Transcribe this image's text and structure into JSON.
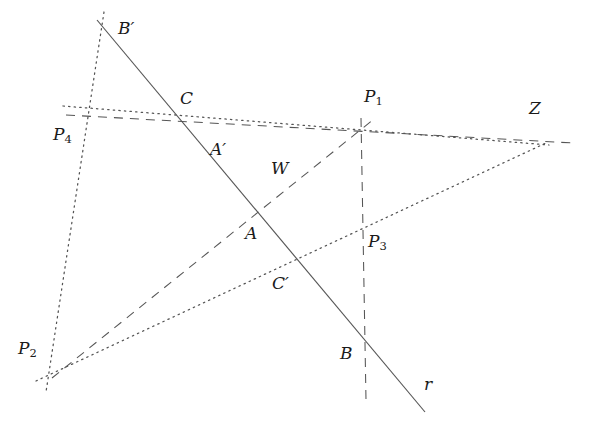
{
  "figure": {
    "title": "Projective geometry construction: line r with points B', C, A', A, C', B and centers P1, P2, P3, P4, W, Z",
    "width": 594,
    "height": 431,
    "background_color": "#ffffff",
    "stroke_color": "#555555",
    "label_color": "#1a1a1a"
  },
  "labels": [
    {
      "id": "B-prime",
      "base": "B",
      "prime": "′",
      "sub": "",
      "x": 118,
      "y": 20,
      "name": "label-b-prime"
    },
    {
      "id": "C",
      "base": "C",
      "prime": "",
      "sub": "",
      "x": 180,
      "y": 90,
      "name": "label-c"
    },
    {
      "id": "P1",
      "base": "P",
      "prime": "",
      "sub": "1",
      "x": 364,
      "y": 88,
      "name": "label-p1"
    },
    {
      "id": "Z",
      "base": "Z",
      "prime": "",
      "sub": "",
      "x": 529,
      "y": 100,
      "name": "label-z"
    },
    {
      "id": "P4",
      "base": "P",
      "prime": "",
      "sub": "4",
      "x": 53,
      "y": 126,
      "name": "label-p4"
    },
    {
      "id": "A-prime",
      "base": "A",
      "prime": "′",
      "sub": "",
      "x": 210,
      "y": 141,
      "name": "label-a-prime"
    },
    {
      "id": "W",
      "base": "W",
      "prime": "",
      "sub": "",
      "x": 271,
      "y": 160,
      "name": "label-w"
    },
    {
      "id": "A",
      "base": "A",
      "prime": "",
      "sub": "",
      "x": 245,
      "y": 225,
      "name": "label-a"
    },
    {
      "id": "P3",
      "base": "P",
      "prime": "",
      "sub": "3",
      "x": 368,
      "y": 233,
      "name": "label-p3"
    },
    {
      "id": "C-prime",
      "base": "C",
      "prime": "′",
      "sub": "",
      "x": 272,
      "y": 275,
      "name": "label-c-prime"
    },
    {
      "id": "P2",
      "base": "P",
      "prime": "",
      "sub": "2",
      "x": 18,
      "y": 340,
      "name": "label-p2"
    },
    {
      "id": "B",
      "base": "B",
      "prime": "",
      "sub": "",
      "x": 340,
      "y": 345,
      "name": "label-b"
    },
    {
      "id": "r",
      "base": "r",
      "prime": "",
      "sub": "",
      "x": 424,
      "y": 376,
      "name": "label-r"
    }
  ],
  "points": {
    "B_prime": {
      "x": 105,
      "y": 28
    },
    "C": {
      "x": 177,
      "y": 123
    },
    "A_prime": {
      "x": 210,
      "y": 155
    },
    "A": {
      "x": 248,
      "y": 225
    },
    "C_prime": {
      "x": 293,
      "y": 275
    },
    "B": {
      "x": 365,
      "y": 344
    },
    "P1": {
      "x": 362,
      "y": 131
    },
    "P2": {
      "x": 58,
      "y": 372
    },
    "P3": {
      "x": 363,
      "y": 224
    },
    "P4": {
      "x": 93,
      "y": 117
    },
    "W": {
      "x": 285,
      "y": 191
    },
    "Z": {
      "x": 543,
      "y": 140
    }
  },
  "lines": [
    {
      "id": "line-r",
      "name": "line-r-solid",
      "style": "solid",
      "from": {
        "x": 97,
        "y": 20
      },
      "to": {
        "x": 425,
        "y": 412
      }
    },
    {
      "id": "line-p4-p1-z",
      "name": "line-p4-c-p1-z-dashed",
      "style": "dashed",
      "from": {
        "x": 66,
        "y": 115
      },
      "to": {
        "x": 573,
        "y": 143
      }
    },
    {
      "id": "line-p2-a-w-p1",
      "name": "line-p2-a-w-p1-dashed",
      "style": "dashed",
      "from": {
        "x": 52,
        "y": 378
      },
      "to": {
        "x": 374,
        "y": 119
      }
    },
    {
      "id": "line-p1-p3-b",
      "name": "line-p1-p3-b-vertical-dashed",
      "style": "dashed",
      "from": {
        "x": 361,
        "y": 118
      },
      "to": {
        "x": 366,
        "y": 400
      }
    },
    {
      "id": "line-bprime-p4-p2",
      "name": "line-bprime-p4-p2-dotted",
      "style": "dotted",
      "from": {
        "x": 104,
        "y": 12
      },
      "to": {
        "x": 46,
        "y": 392
      }
    },
    {
      "id": "line-p4-aprime-w-p3-z",
      "name": "line-p4-aprime-w-p3-z-dotted",
      "style": "dotted",
      "from": {
        "x": 63,
        "y": 106
      },
      "to": {
        "x": 549,
        "y": 145
      }
    },
    {
      "id": "line-p2-cprime-p3",
      "name": "line-p2-cprime-p3-z-dotted",
      "style": "dotted",
      "from": {
        "x": 36,
        "y": 381
      },
      "to": {
        "x": 546,
        "y": 143
      }
    }
  ]
}
